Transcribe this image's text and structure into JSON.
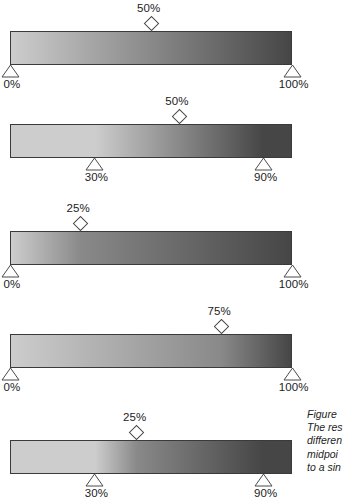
{
  "figure": {
    "type": "technical-illustration",
    "canvas": {
      "width": 358,
      "height": 499,
      "background": "#ffffff"
    },
    "colors": {
      "gradient_start": "#cdcdcd",
      "gradient_end": "#464646",
      "bar_stroke": "#3a3a3a",
      "marker_stroke": "#4a4a4a",
      "marker_fill": "#ffffff",
      "text": "#222222"
    },
    "geometry": {
      "track_left": 10,
      "track_right": 292,
      "bar_height": 34,
      "bar_tops": [
        31,
        124,
        231,
        334,
        440
      ]
    }
  },
  "bars": [
    {
      "id": "bar-1",
      "start_stop": {
        "label": "0%",
        "position": 0
      },
      "end_stop": {
        "label": "100%",
        "position": 100
      },
      "midpoint": {
        "label": "50%",
        "position": 50
      }
    },
    {
      "id": "bar-2",
      "start_stop": {
        "label": "30%",
        "position": 30
      },
      "end_stop": {
        "label": "90%",
        "position": 90
      },
      "midpoint": {
        "label": "50%",
        "position": 50
      }
    },
    {
      "id": "bar-3",
      "start_stop": {
        "label": "0%",
        "position": 0
      },
      "end_stop": {
        "label": "100%",
        "position": 100
      },
      "midpoint": {
        "label": "25%",
        "position": 25
      }
    },
    {
      "id": "bar-4",
      "start_stop": {
        "label": "0%",
        "position": 0
      },
      "end_stop": {
        "label": "100%",
        "position": 100
      },
      "midpoint": {
        "label": "75%",
        "position": 75
      }
    },
    {
      "id": "bar-5",
      "start_stop": {
        "label": "30%",
        "position": 30
      },
      "end_stop": {
        "label": "90%",
        "position": 90
      },
      "midpoint": {
        "label": "25%",
        "position": 25
      }
    }
  ],
  "caption": {
    "lines": [
      "Figure",
      "The res",
      "differen",
      "midpoi",
      "to a sin"
    ],
    "clipped": true
  }
}
